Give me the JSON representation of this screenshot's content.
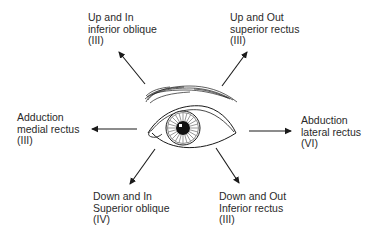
{
  "diagram": {
    "center": "eye",
    "colors": {
      "ink": "#1a1a1a",
      "text": "#2a2a2a",
      "background": "#ffffff"
    },
    "directions": [
      {
        "id": "up-in",
        "line1": "Up and In",
        "line2": "inferior oblique",
        "line3": "(III)"
      },
      {
        "id": "up-out",
        "line1": "Up and Out",
        "line2": "superior rectus",
        "line3": "(III)"
      },
      {
        "id": "adduction",
        "line1": "Adduction",
        "line2": "medial rectus",
        "line3": "(III)"
      },
      {
        "id": "abduction",
        "line1": "Abduction",
        "line2": "lateral rectus",
        "line3": "(VI)"
      },
      {
        "id": "down-in",
        "line1": "Down and In",
        "line2": "Superior oblique",
        "line3": "(IV)"
      },
      {
        "id": "down-out",
        "line1": "Down and Out",
        "line2": "Inferior rectus",
        "line3": "(III)"
      }
    ]
  }
}
